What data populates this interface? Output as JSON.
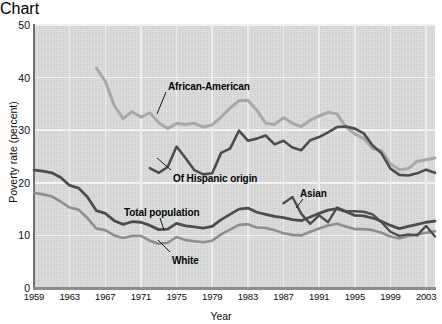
{
  "chart_data": {
    "type": "line",
    "title": "",
    "xlabel": "Year",
    "ylabel": "Poverty rate (percent)",
    "xlim": [
      1959,
      2004
    ],
    "ylim": [
      0,
      50
    ],
    "grid": true,
    "legend_position": "inline-annotations",
    "xticks": [
      "1959",
      "1963",
      "1967",
      "1971",
      "1975",
      "1979",
      "1983",
      "1987",
      "1991",
      "1995",
      "1999",
      "2003"
    ],
    "yticks": [
      "0",
      "10",
      "20",
      "30",
      "40",
      "50"
    ],
    "series": [
      {
        "name": "African-American",
        "color": "#a8a8a8",
        "label_x": 168,
        "label_y": 63,
        "leader": "M 166 74 L 157 96",
        "x": [
          1966,
          1967,
          1968,
          1969,
          1970,
          1971,
          1972,
          1973,
          1974,
          1975,
          1976,
          1977,
          1978,
          1979,
          1980,
          1981,
          1982,
          1983,
          1984,
          1985,
          1986,
          1987,
          1988,
          1989,
          1990,
          1991,
          1992,
          1993,
          1994,
          1995,
          1996,
          1997,
          1998,
          1999,
          2000,
          2001,
          2002,
          2003,
          2004
        ],
        "values": [
          41.8,
          39.3,
          34.7,
          32.2,
          33.5,
          32.5,
          33.3,
          31.4,
          30.3,
          31.3,
          31.1,
          31.3,
          30.6,
          31.0,
          32.5,
          34.2,
          35.6,
          35.7,
          33.8,
          31.3,
          31.1,
          32.4,
          31.3,
          30.7,
          31.9,
          32.7,
          33.4,
          33.1,
          30.6,
          29.3,
          28.4,
          26.5,
          26.1,
          23.6,
          22.5,
          22.7,
          24.1,
          24.4,
          24.7
        ]
      },
      {
        "name": "Of Hispanic origin",
        "color": "#4d4d4d",
        "label_x": 173,
        "label_y": 155,
        "leader": "M 171 152 L 157 140",
        "x": [
          1972,
          1973,
          1974,
          1975,
          1976,
          1977,
          1978,
          1979,
          1980,
          1981,
          1982,
          1983,
          1984,
          1985,
          1986,
          1987,
          1988,
          1989,
          1990,
          1991,
          1992,
          1993,
          1994,
          1995,
          1996,
          1997,
          1998,
          1999,
          2000,
          2001,
          2002,
          2003,
          2004
        ],
        "values": [
          22.8,
          21.9,
          23.0,
          26.9,
          24.7,
          22.4,
          21.6,
          21.8,
          25.7,
          26.5,
          29.9,
          28.0,
          28.4,
          29.0,
          27.3,
          28.0,
          26.7,
          26.2,
          28.1,
          28.7,
          29.6,
          30.6,
          30.7,
          30.3,
          29.4,
          27.1,
          25.6,
          22.7,
          21.5,
          21.4,
          21.8,
          22.5,
          21.9
        ]
      },
      {
        "name": "Asian",
        "color": "#4d4d4d",
        "label_x": 300,
        "label_y": 170,
        "leader": "M 303 181 L 296 190",
        "x": [
          1987,
          1988,
          1989,
          1990,
          1991,
          1992,
          1993,
          1994,
          1995,
          1996,
          1997,
          1998,
          1999,
          2000,
          2001,
          2002,
          2003,
          2004
        ],
        "values": [
          16.1,
          17.3,
          14.1,
          12.2,
          13.8,
          12.5,
          15.3,
          14.6,
          14.6,
          14.5,
          14.0,
          12.5,
          10.7,
          9.9,
          10.2,
          10.0,
          11.8,
          9.8
        ]
      },
      {
        "name": "Total population",
        "color": "#4d4d4d",
        "label_x": 124,
        "label_y": 189,
        "leader": "M 160 200 L 164 212",
        "x": [
          1959,
          1960,
          1961,
          1962,
          1963,
          1964,
          1965,
          1966,
          1967,
          1968,
          1969,
          1970,
          1971,
          1972,
          1973,
          1974,
          1975,
          1976,
          1977,
          1978,
          1979,
          1980,
          1981,
          1982,
          1983,
          1984,
          1985,
          1986,
          1987,
          1988,
          1989,
          1990,
          1991,
          1992,
          1993,
          1994,
          1995,
          1996,
          1997,
          1998,
          1999,
          2000,
          2001,
          2002,
          2003,
          2004
        ],
        "values": [
          22.4,
          22.2,
          21.9,
          21.0,
          19.5,
          19.0,
          17.3,
          14.7,
          14.2,
          12.8,
          12.1,
          12.6,
          12.5,
          11.9,
          11.1,
          11.2,
          12.3,
          11.8,
          11.6,
          11.4,
          11.7,
          13.0,
          14.0,
          15.0,
          15.2,
          14.4,
          14.0,
          13.6,
          13.4,
          13.0,
          12.8,
          13.5,
          14.2,
          14.8,
          15.1,
          14.5,
          13.8,
          13.7,
          13.3,
          12.7,
          11.9,
          11.3,
          11.7,
          12.1,
          12.5,
          12.7
        ]
      },
      {
        "name": "White",
        "color": "#8e8e8e",
        "label_x": 172,
        "label_y": 237,
        "leader": "M 170 234 L 158 222",
        "x": [
          1959,
          1960,
          1961,
          1962,
          1963,
          1964,
          1965,
          1966,
          1967,
          1968,
          1969,
          1970,
          1971,
          1972,
          1973,
          1974,
          1975,
          1976,
          1977,
          1978,
          1979,
          1980,
          1981,
          1982,
          1983,
          1984,
          1985,
          1986,
          1987,
          1988,
          1989,
          1990,
          1991,
          1992,
          1993,
          1994,
          1995,
          1996,
          1997,
          1998,
          1999,
          2000,
          2001,
          2002,
          2003,
          2004
        ],
        "values": [
          18.1,
          17.8,
          17.4,
          16.4,
          15.3,
          14.9,
          13.3,
          11.3,
          11.0,
          10.0,
          9.5,
          9.9,
          9.9,
          9.0,
          8.4,
          8.6,
          9.7,
          9.1,
          8.9,
          8.7,
          9.0,
          10.2,
          11.1,
          12.0,
          12.1,
          11.5,
          11.4,
          11.0,
          10.4,
          10.1,
          10.0,
          10.7,
          11.3,
          11.9,
          12.2,
          11.7,
          11.2,
          11.2,
          11.0,
          10.5,
          9.8,
          9.4,
          9.9,
          10.2,
          10.5,
          10.8
        ]
      }
    ]
  },
  "axes": {
    "x_title": "Year",
    "y_title": "Poverty rate (percent)"
  }
}
